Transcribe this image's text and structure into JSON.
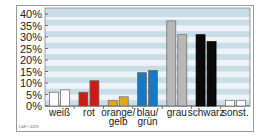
{
  "chart_data": {
    "type": "bar",
    "title": "",
    "xlabel": "",
    "ylabel": "",
    "ylim": [
      0,
      40
    ],
    "yticks": [
      "0%",
      "5%",
      "10%",
      "15%",
      "20%",
      "25%",
      "30%",
      "35%",
      "40%"
    ],
    "grid": "horizontal alternating bands",
    "legend": "none",
    "categories": [
      "weiß",
      "rot",
      "orange/\ngelb",
      "blau/\ngrün",
      "grau",
      "schwarz",
      "sonst."
    ],
    "category_lines": [
      [
        "weiß"
      ],
      [
        "rot"
      ],
      [
        "orange/",
        "gelb"
      ],
      [
        "blau/",
        "grün"
      ],
      [
        "grau"
      ],
      [
        "schwarz"
      ],
      [
        "sonst."
      ]
    ],
    "series": [
      {
        "name": "series 1",
        "values": [
          6,
          6,
          2.5,
          14.5,
          37,
          31,
          2.5
        ]
      },
      {
        "name": "series 2",
        "values": [
          7,
          11,
          4,
          15.5,
          31,
          28,
          2.5
        ]
      }
    ],
    "colors": [
      "#ffffff",
      "#cc1a14",
      "#e0a820",
      "#1a78c2",
      "#b8b8b8",
      "#0a0a0a",
      "#ffffff"
    ],
    "band_colors": [
      "#c9dde6",
      "#edf3f6"
    ],
    "footer": "L&F / 4229"
  }
}
